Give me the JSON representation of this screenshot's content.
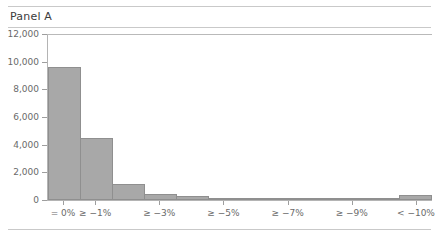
{
  "panel": {
    "title": "Panel A"
  },
  "chart_data": {
    "type": "bar",
    "title": "Panel A",
    "xlabel": "",
    "ylabel": "",
    "ylim": [
      0,
      12000
    ],
    "grid": false,
    "legend": null,
    "bar_color": "#a8a8a8",
    "bar_edge_color": "#8f8f8f",
    "yticks": [
      0,
      2000,
      4000,
      6000,
      8000,
      10000,
      12000
    ],
    "ytick_labels": [
      "0",
      "2,000",
      "4,000",
      "6,000",
      "8,000",
      "10,000",
      "12,000"
    ],
    "xtick_labels": [
      "= 0%",
      "≥ −1%",
      "≥ −3%",
      "≥ −5%",
      "≥ −7%",
      "≥ −9%",
      "< −10%"
    ],
    "categories": [
      "= 0%",
      "≥ −1%",
      "≥ −2%",
      "≥ −3%",
      "≥ −4%",
      "≥ −5%",
      "≥ −6%",
      "≥ −7%",
      "≥ −8%",
      "≥ −9%",
      "≥ −10%",
      "< −10%"
    ],
    "values": [
      9600,
      4480,
      1160,
      420,
      260,
      180,
      130,
      95,
      70,
      55,
      45,
      330
    ]
  }
}
